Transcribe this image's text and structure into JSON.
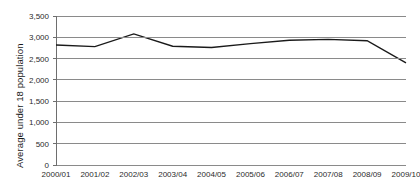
{
  "chart_data": {
    "type": "line",
    "title": "",
    "subtitle": "",
    "xlabel": "",
    "ylabel": "Average under 18 population",
    "categories": [
      "2000/01",
      "2001/02",
      "2002/03",
      "2003/04",
      "2004/05",
      "2005/06",
      "2006/07",
      "2007/08",
      "2008/09",
      "2009/10"
    ],
    "values": [
      2820,
      2780,
      3080,
      2790,
      2760,
      2850,
      2930,
      2950,
      2920,
      2400
    ],
    "series": [
      {
        "name": "Average under 18 population",
        "values": [
          2820,
          2780,
          3080,
          2790,
          2760,
          2850,
          2930,
          2950,
          2920,
          2400
        ]
      }
    ],
    "ylim": [
      0,
      3500
    ],
    "ytick_values": [
      0,
      500,
      1000,
      1500,
      2000,
      2500,
      3000,
      3500
    ],
    "ytick_labels": [
      "0",
      "500",
      "1,000",
      "1,500",
      "2,000",
      "2,500",
      "3,000",
      "3,500"
    ],
    "grid": true,
    "grid_axis": "y",
    "legend": false,
    "legend_position": "none",
    "line_color": "#1a1a1a",
    "grid_color": "#8a8a8a",
    "axis_color": "#6e6e6e",
    "background_color": "#ffffff",
    "markers": false,
    "annotations": []
  }
}
